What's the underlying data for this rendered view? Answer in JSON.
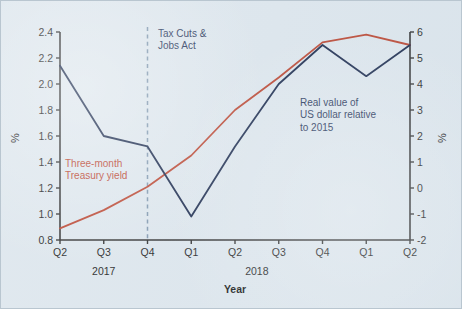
{
  "figure": {
    "background_color": "#dde6ed",
    "border_color": "#b9c6d0"
  },
  "annotations": {
    "tax_event": {
      "line1": "Tax Cuts &",
      "line2": "Jobs Act",
      "color": "#1d3257",
      "at_category": "Q4 2017"
    },
    "dollar_label": {
      "line1": "Real value of",
      "line2": "US dollar relative",
      "line3": "to 2015",
      "color": "#1d3257"
    },
    "yield_label": {
      "line1": "Three-month",
      "line2": "Treasury yield",
      "color": "#b9412c"
    }
  },
  "chart_data": {
    "type": "line",
    "title": "",
    "xlabel": "Year",
    "ylabel": "%",
    "y2label": "%",
    "grid": false,
    "legend": "annotations",
    "categories": [
      "Q2",
      "Q3",
      "Q4",
      "Q1",
      "Q2",
      "Q3",
      "Q4",
      "Q1",
      "Q2"
    ],
    "year_groups": [
      {
        "label": "2017",
        "categories": [
          "Q2",
          "Q3",
          "Q4"
        ]
      },
      {
        "label": "2018",
        "categories": [
          "Q1",
          "Q2",
          "Q3",
          "Q4"
        ]
      }
    ],
    "left_axis": {
      "label": "%",
      "ylim": [
        0.8,
        2.4
      ],
      "ticks": [
        0.8,
        1.0,
        1.2,
        1.4,
        1.6,
        1.8,
        2.0,
        2.2,
        2.4
      ],
      "tick_labels": [
        "0.8",
        "1.0",
        "1.2",
        "1.4",
        "1.6",
        "1.8",
        "2.0",
        "2.2",
        "2.4"
      ]
    },
    "right_axis": {
      "label": "%",
      "ylim": [
        -2,
        6
      ],
      "ticks": [
        -2,
        -1,
        0,
        1,
        2,
        3,
        4,
        5,
        6
      ],
      "tick_labels": [
        "-2",
        "-1",
        "0",
        "1",
        "2",
        "3",
        "4",
        "5",
        "6"
      ]
    },
    "series": [
      {
        "name": "Real value of US dollar relative to 2015",
        "axis": "right",
        "color": "#16264a",
        "values": [
          4.7,
          2.0,
          1.6,
          -1.1,
          1.6,
          4.0,
          5.5,
          4.3,
          5.5
        ]
      },
      {
        "name": "Three-month Treasury yield",
        "axis": "left",
        "color": "#b9412c",
        "values": [
          0.89,
          1.03,
          1.21,
          1.45,
          1.8,
          2.05,
          2.32,
          2.38,
          2.3
        ]
      }
    ],
    "event_markers": [
      {
        "label": "Tax Cuts & Jobs Act",
        "category_index": 2,
        "style": "dashed"
      }
    ]
  }
}
